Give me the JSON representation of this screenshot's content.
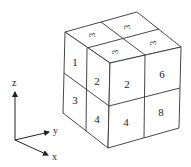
{
  "diagram": {
    "type": "2x2x2 cube octant labeling",
    "colors": {
      "line": "#333333",
      "text": "#222222",
      "background": "#ffffff"
    },
    "top_face_labels": [
      {
        "text": "3",
        "x": 92,
        "y": 35
      },
      {
        "text": "3",
        "x": 127,
        "y": 27
      },
      {
        "text": "3",
        "x": 115,
        "y": 52
      },
      {
        "text": "3",
        "x": 153,
        "y": 43
      }
    ],
    "left_face_labels": [
      {
        "text": "1",
        "x": 75,
        "y": 66
      },
      {
        "text": "2",
        "x": 97,
        "y": 83
      },
      {
        "text": "3",
        "x": 75,
        "y": 104
      },
      {
        "text": "4",
        "x": 97,
        "y": 122
      }
    ],
    "right_face_labels": [
      {
        "text": "2",
        "x": 127,
        "y": 88
      },
      {
        "text": "6",
        "x": 162,
        "y": 78
      },
      {
        "text": "4",
        "x": 126,
        "y": 126
      },
      {
        "text": "8",
        "x": 161,
        "y": 116
      }
    ],
    "axes": {
      "z": {
        "label": "z",
        "x": 15,
        "y": 86
      },
      "y": {
        "label": "y",
        "x": 55,
        "y": 134
      },
      "x": {
        "label": "x",
        "x": 54,
        "y": 160
      }
    }
  }
}
